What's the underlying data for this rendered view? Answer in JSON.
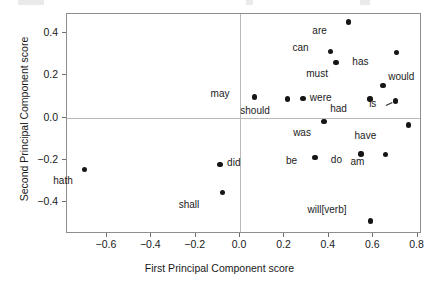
{
  "chart_data": {
    "type": "scatter",
    "title": "",
    "xlabel": "First Principal Component score",
    "ylabel": "Second Principal Component score",
    "xlim": [
      -0.78,
      0.82
    ],
    "ylim": [
      -0.55,
      0.49
    ],
    "xticks": [
      -0.6,
      -0.4,
      -0.2,
      0.0,
      0.2,
      0.4,
      0.6,
      0.8
    ],
    "xticklabels": [
      "−0.6",
      "−0.4",
      "−0.2",
      "0.0",
      "0.2",
      "0.4",
      "0.6",
      "0.8"
    ],
    "yticks": [
      0.4,
      0.2,
      0.0,
      -0.2,
      -0.4
    ],
    "yticklabels": [
      "0.4",
      "0.2",
      "0.0",
      "−0.2",
      "−0.4"
    ],
    "grid": false,
    "zero_lines": true,
    "legend": null,
    "marker_color": "#161616",
    "points": [
      {
        "label": "hath",
        "x": -0.7,
        "y": -0.245,
        "lx": -12,
        "ly": 12
      },
      {
        "label": "did",
        "x": -0.09,
        "y": -0.222,
        "lx": 7,
        "ly": -2
      },
      {
        "label": "shall",
        "x": -0.08,
        "y": -0.355,
        "lx": -23,
        "ly": 12
      },
      {
        "label": "may",
        "x": 0.065,
        "y": 0.098,
        "lx": -25,
        "ly": -3
      },
      {
        "label": "should",
        "x": 0.215,
        "y": 0.088,
        "lx": -18,
        "ly": 12
      },
      {
        "label": "were",
        "x": 0.283,
        "y": 0.092,
        "lx": 7,
        "ly": 0
      },
      {
        "label": "be",
        "x": 0.338,
        "y": -0.188,
        "lx": -18,
        "ly": 4
      },
      {
        "label": "was",
        "x": 0.378,
        "y": -0.018,
        "lx": -13,
        "ly": 12
      },
      {
        "label": "can",
        "x": 0.408,
        "y": 0.313,
        "lx": -22,
        "ly": -3
      },
      {
        "label": "must",
        "x": 0.432,
        "y": 0.262,
        "lx": -8,
        "ly": 12
      },
      {
        "label": "are",
        "x": 0.49,
        "y": 0.452,
        "lx": -22,
        "ly": 9
      },
      {
        "label": "do",
        "x": 0.545,
        "y": -0.172,
        "lx": -19,
        "ly": 6
      },
      {
        "label": "will[verb]",
        "x": 0.588,
        "y": -0.488,
        "lx": -24,
        "ly": -11
      },
      {
        "label": "had",
        "x": 0.585,
        "y": 0.089,
        "lx": -23,
        "ly": 10
      },
      {
        "label": "am",
        "x": 0.655,
        "y": -0.175,
        "lx": -21,
        "ly": 7
      },
      {
        "label": "would",
        "x": 0.645,
        "y": 0.152,
        "lx": 5,
        "ly": -9
      },
      {
        "label": "is",
        "x": 0.7,
        "y": 0.078,
        "lx": -19,
        "ly": 3
      },
      {
        "label": "has",
        "x": 0.705,
        "y": 0.308,
        "lx": -28,
        "ly": 9
      },
      {
        "label": "have",
        "x": 0.758,
        "y": -0.035,
        "lx": -32,
        "ly": 11
      }
    ]
  },
  "axes": {
    "x_title": "First Principal Component score",
    "y_title": "Second Principal Component score"
  },
  "style": {
    "frame_color": "#8e8e8e",
    "zero_line_color": "#b9b9b9",
    "point_color": "#161616",
    "text_color": "#1a1a1a"
  }
}
